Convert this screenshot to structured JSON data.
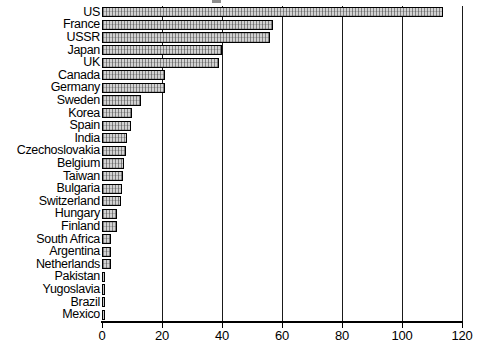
{
  "chart_data": {
    "type": "bar",
    "orientation": "horizontal",
    "title": "",
    "xlabel": "",
    "ylabel": "",
    "xlim": [
      0,
      120
    ],
    "xticks": [
      0,
      20,
      40,
      60,
      80,
      100,
      120
    ],
    "xtick_labels": [
      "0",
      "20",
      "40",
      "60",
      "80",
      "100",
      "120"
    ],
    "grid": true,
    "grid_axis": "x",
    "legend": false,
    "categories": [
      "US",
      "France",
      "USSR",
      "Japan",
      "UK",
      "Canada",
      "Germany",
      "Sweden",
      "Korea",
      "Spain",
      "India",
      "Czechoslovakia",
      "Belgium",
      "Taiwan",
      "Bulgaria",
      "Switzerland",
      "Hungary",
      "Finland",
      "South Africa",
      "Argentina",
      "Netherlands",
      "Pakistan",
      "Yugoslavia",
      "Brazil",
      "Mexico"
    ],
    "values": [
      113.5,
      57,
      56,
      40,
      39,
      21,
      21,
      13,
      10,
      9.7,
      8.3,
      8,
      7.3,
      7,
      6.7,
      6.3,
      5,
      5,
      3,
      3,
      3,
      1,
      1,
      1,
      1
    ],
    "bar_fill_color": "#d2d2d2",
    "bar_edge_color": "#000000"
  }
}
